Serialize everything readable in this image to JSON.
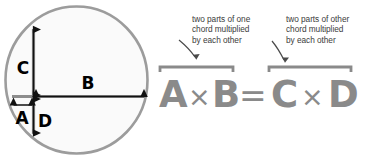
{
  "figure": {
    "circle": {
      "fill": "#fbfbfb",
      "stroke": "#9a9a9a"
    },
    "segment_labels": [
      {
        "id": "A",
        "label": "A"
      },
      {
        "id": "B",
        "label": "B"
      },
      {
        "id": "C",
        "label": "C"
      },
      {
        "id": "D",
        "label": "D"
      }
    ],
    "label_color": "#000000",
    "chord_color": "#8d8d8d"
  },
  "annotations": [
    {
      "id": "left-note",
      "lines": [
        "two parts of one",
        "chord multiplied",
        "by each other"
      ]
    },
    {
      "id": "right-note",
      "lines": [
        "two parts of other",
        "chord multiplied",
        "by each other"
      ]
    }
  ],
  "equation": {
    "text": "A × B = C × D",
    "color": "#8a8a8a",
    "tokens": [
      {
        "id": "tok-a",
        "text": "A"
      },
      {
        "id": "tok-mul1",
        "text": "×"
      },
      {
        "id": "tok-b",
        "text": "B"
      },
      {
        "id": "tok-eq",
        "text": "="
      },
      {
        "id": "tok-c",
        "text": "C"
      },
      {
        "id": "tok-mul2",
        "text": "×"
      },
      {
        "id": "tok-d",
        "text": "D"
      }
    ],
    "braces": [
      {
        "id": "brace-left",
        "spans": "A × B"
      },
      {
        "id": "brace-right",
        "spans": "C × D"
      }
    ]
  }
}
